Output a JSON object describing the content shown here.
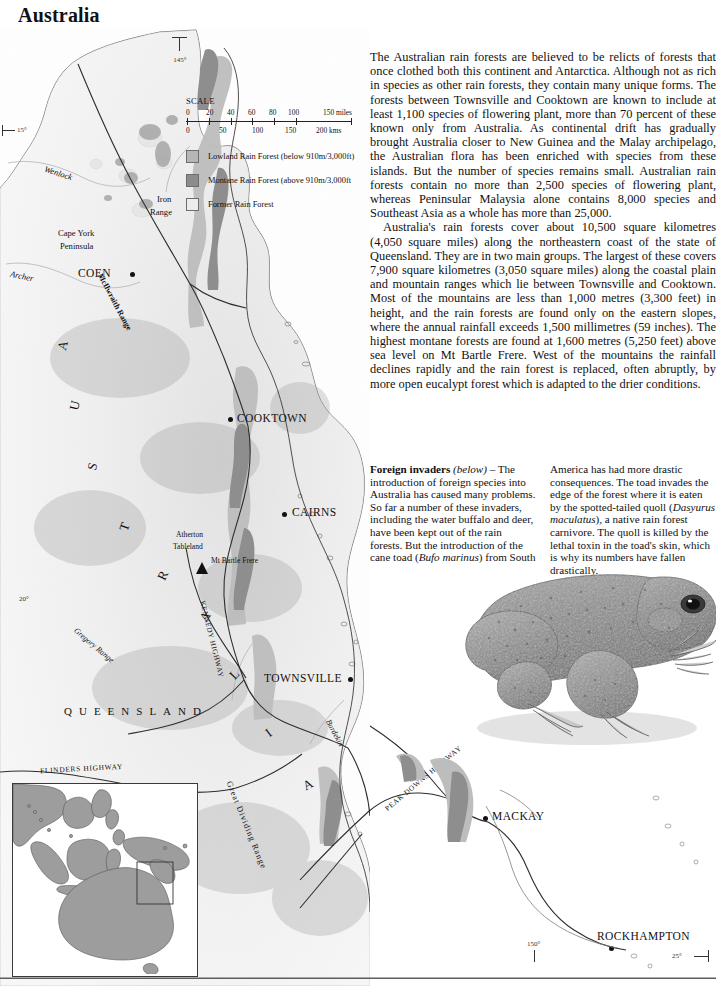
{
  "page": {
    "title": "Australia"
  },
  "text_column": {
    "paragraphs": [
      "The Australian rain forests are believed to be relicts of forests that once clothed both this continent and Antarctica. Although not as rich in species as other rain forests, they contain many unique forms. The forests between Townsville and Cooktown are known to include at least 1,100 species of flowering plant, more than 70 percent of these known only from Australia. As continental drift has gradually brought Australia closer to New Guinea and the Malay archipelago, the Australian flora has been enriched with species from these islands. But the number of species remains small. Australian rain forests contain no more than 2,500 species of flowering plant, whereas Peninsular Malaysia alone contains 8,000 species and Southeast Asia as a whole has more than 25,000.",
      "Australia's rain forests cover about 10,500 square kilometres (4,050 square miles) along the northeastern coast of the state of Queensland. They are in two main groups. The largest of these covers 7,900 square kilometres (3,050 square miles) along the coastal plain and mountain ranges which lie between Townsville and Cooktown. Most of the mountains are less than 1,000 metres (3,300 feet) in height, and the rain forests are found only on the eastern slopes, where the annual rainfall exceeds 1,500 millimetres (59 inches). The highest montane forests are found at 1,600 metres (5,250 feet) above sea level on Mt Bartle Frere. West of the mountains the rainfall declines rapidly and the rain forest is replaced, often abruptly, by more open eucalypt forest which is adapted to the drier conditions."
    ]
  },
  "caption": {
    "heading": "Foreign invaders",
    "heading_italic": "(below)",
    "left_text": " – The introduction of foreign species into Australia has caused many problems. So far a number of these invaders, including the water buffalo and deer, have been kept out of the rain forests. But the introduction of the cane toad (",
    "left_species": "Bufo marinus",
    "left_tail": ") from South",
    "right_head": "America has had more drastic consequences. The toad invades the edge of the forest where it is eaten by the spotted-tailed quoll (",
    "right_species": "Dasyurus maculatus",
    "right_tail": "), a native rain forest carnivore. The quoll is killed by the lethal toxin in the toad's skin, which is why its numbers have fallen drastically."
  },
  "scale": {
    "title": "SCALE",
    "miles_ticks": [
      "0",
      "20",
      "40",
      "60",
      "80",
      "100"
    ],
    "miles_unit": "150 miles",
    "km_ticks": [
      "0",
      "50",
      "100",
      "150"
    ],
    "km_unit": "200 kms"
  },
  "legend": {
    "items": [
      {
        "label": "Lowland Rain Forest (below 910m/3,000ft)",
        "color": "#b6b6b6",
        "key": "lowland"
      },
      {
        "label": "Montane Rain Forest (above 910m/3,000ft",
        "color": "#8c8c8c",
        "key": "montane"
      },
      {
        "label": "Former Rain Forest",
        "color": "#ececec",
        "key": "former"
      }
    ]
  },
  "coordinates": {
    "lon_145": "145°",
    "lat_15": "15°",
    "lat_20": "20°",
    "lon_150": "150°",
    "lat_25": "25°"
  },
  "map_labels": {
    "cities": [
      {
        "name": "COEN",
        "x": 78,
        "y": 246
      },
      {
        "name": "COOKTOWN",
        "x": 233,
        "y": 391
      },
      {
        "name": "CAIRNS",
        "x": 289,
        "y": 484
      },
      {
        "name": "TOWNSVILLE",
        "x": 264,
        "y": 651
      },
      {
        "name": "MACKAY",
        "x": 495,
        "y": 818
      },
      {
        "name": "ROCKHAMPTON",
        "x": 597,
        "y": 937
      }
    ],
    "features": [
      {
        "name": "Wenlock",
        "x": 48,
        "y": 146
      },
      {
        "name": "Iron",
        "x": 160,
        "y": 172
      },
      {
        "name": "Range",
        "x": 155,
        "y": 185
      },
      {
        "name": "Cape York",
        "x": 60,
        "y": 205
      },
      {
        "name": "Peninsula",
        "x": 62,
        "y": 218
      },
      {
        "name": "Archer",
        "x": 12,
        "y": 247
      },
      {
        "name": "McIlwraith Range",
        "x": 110,
        "y": 255
      },
      {
        "name": "Atherton",
        "x": 175,
        "y": 508
      },
      {
        "name": "Tableland",
        "x": 172,
        "y": 520
      },
      {
        "name": "Mt Bartle Frere",
        "x": 206,
        "y": 525
      },
      {
        "name": "Gregory Range",
        "x": 82,
        "y": 605
      },
      {
        "name": "KENNEDY HIGHWAY",
        "x": 206,
        "y": 580
      },
      {
        "name": "Burdekin",
        "x": 330,
        "y": 700
      },
      {
        "name": "FLINDERS HIGHWAY",
        "x": 42,
        "y": 742
      },
      {
        "name": "Great Dividing Range",
        "x": 233,
        "y": 760
      },
      {
        "name": "PEAK DOWNS HIGHWAY",
        "x": 383,
        "y": 806
      },
      {
        "name": "QUEENSLAND",
        "x": 65,
        "y": 684
      }
    ],
    "country_letters": [
      "A",
      "U",
      "S",
      "T",
      "R",
      "A",
      "L",
      "I",
      "A"
    ]
  }
}
